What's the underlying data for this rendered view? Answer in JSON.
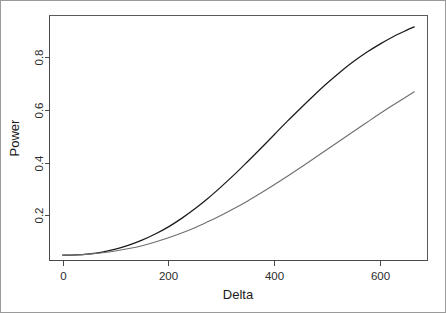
{
  "chart_data": {
    "type": "line",
    "title": "",
    "subtitle": "",
    "xlabel": "Delta",
    "ylabel": "Power",
    "xlim": [
      -25,
      690
    ],
    "ylim": [
      0.03,
      0.955
    ],
    "grid": false,
    "legend": null,
    "legend_position": "none",
    "xticks": [
      0,
      200,
      400,
      600
    ],
    "xtick_labels": [
      "0",
      "200",
      "400",
      "600"
    ],
    "yticks": [
      0.2,
      0.4,
      0.6,
      0.8
    ],
    "ytick_labels": [
      "0.2",
      "0.4",
      "0.6",
      "0.8"
    ],
    "annotations": [],
    "series": [
      {
        "name": "upper-curve",
        "color": "#1a1a1a",
        "x": [
          0,
          25,
          50,
          75,
          100,
          125,
          150,
          175,
          200,
          225,
          250,
          275,
          300,
          325,
          350,
          375,
          400,
          425,
          450,
          475,
          500,
          525,
          550,
          575,
          600,
          625,
          650,
          665
        ],
        "y": [
          0.05,
          0.051,
          0.055,
          0.062,
          0.073,
          0.088,
          0.107,
          0.13,
          0.157,
          0.189,
          0.225,
          0.265,
          0.309,
          0.355,
          0.404,
          0.454,
          0.505,
          0.556,
          0.605,
          0.653,
          0.699,
          0.742,
          0.781,
          0.816,
          0.847,
          0.875,
          0.899,
          0.912
        ]
      },
      {
        "name": "lower-curve",
        "color": "#6e6e6e",
        "x": [
          0,
          25,
          50,
          75,
          100,
          125,
          150,
          175,
          200,
          225,
          250,
          275,
          300,
          325,
          350,
          375,
          400,
          425,
          450,
          475,
          500,
          525,
          550,
          575,
          600,
          625,
          650,
          665
        ],
        "y": [
          0.05,
          0.051,
          0.054,
          0.059,
          0.066,
          0.075,
          0.086,
          0.1,
          0.116,
          0.134,
          0.154,
          0.177,
          0.201,
          0.227,
          0.255,
          0.285,
          0.316,
          0.348,
          0.381,
          0.415,
          0.449,
          0.483,
          0.517,
          0.551,
          0.585,
          0.617,
          0.648,
          0.667
        ]
      }
    ]
  },
  "axes": {
    "x_title": "Delta",
    "y_title": "Power"
  }
}
